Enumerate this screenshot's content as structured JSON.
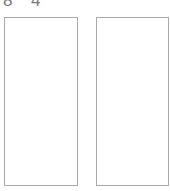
{
  "header": {
    "digits": [
      "8",
      "4"
    ]
  },
  "panels": [
    {
      "name": "left-panel"
    },
    {
      "name": "right-panel"
    }
  ],
  "colors": {
    "border": "#aaaaaa",
    "text": "#777777",
    "background": "#ffffff"
  }
}
